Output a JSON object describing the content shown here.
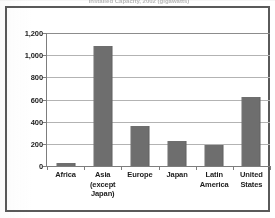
{
  "title_strip": {
    "text": "Installed Capacity, 2002 (gigawatts)"
  },
  "chart_data": {
    "type": "bar",
    "title": "Installed Capacity, 2002 (gigawatts)",
    "xlabel": "",
    "ylabel": "",
    "categories": [
      "Africa",
      "Asia (except Japan)",
      "Europe",
      "Japan",
      "Latin America",
      "United States"
    ],
    "category_lines": [
      [
        "Africa"
      ],
      [
        "Asia",
        "(except",
        "Japan)"
      ],
      [
        "Europe"
      ],
      [
        "Japan"
      ],
      [
        "Latin",
        "America"
      ],
      [
        "United",
        "States"
      ]
    ],
    "values": [
      30,
      1080,
      360,
      225,
      190,
      625
    ],
    "ylim": [
      0,
      1200
    ],
    "yticks": [
      0,
      200,
      400,
      600,
      800,
      1000,
      1200
    ],
    "ytick_labels": [
      "0",
      "200",
      "400",
      "600",
      "800",
      "1,000",
      "1,200"
    ],
    "grid": true,
    "legend": false,
    "bar_color": "#6e6e6e",
    "gridline_color": "#b3b3b3",
    "axis_color": "#7d7d7d",
    "frame_color": "#5a5a5a"
  }
}
